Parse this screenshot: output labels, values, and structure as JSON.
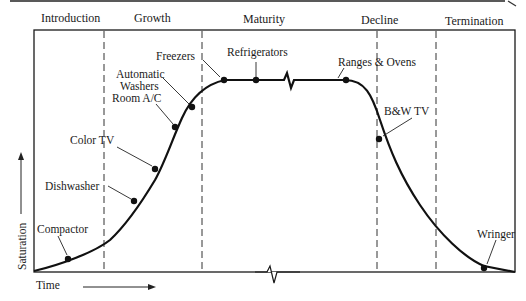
{
  "diagram": {
    "stages": [
      "Introduction",
      "Growth",
      "Maturity",
      "Decline",
      "Termination"
    ],
    "y_axis_label": "Saturation",
    "x_axis_label": "Time",
    "products": [
      {
        "name": "Compactor",
        "stage": "Introduction"
      },
      {
        "name": "Dishwasher",
        "stage": "Growth"
      },
      {
        "name": "Color TV",
        "stage": "Growth"
      },
      {
        "name": "Room A/C",
        "stage": "Growth"
      },
      {
        "name": "Automatic Washers",
        "stage": "Growth"
      },
      {
        "name": "Freezers",
        "stage": "Maturity"
      },
      {
        "name": "Refrigerators",
        "stage": "Maturity"
      },
      {
        "name": "Ranges & Ovens",
        "stage": "Maturity"
      },
      {
        "name": "B&W TV",
        "stage": "Decline"
      },
      {
        "name": "Wringer",
        "stage": "Termination"
      }
    ],
    "labels": {
      "compactor": "Compactor",
      "dishwasher": "Dishwasher",
      "color_tv": "Color TV",
      "room_ac": "Room A/C",
      "automatic_line1": "Automatic",
      "automatic_line2": "Washers",
      "freezers": "Freezers",
      "refrigerators": "Refrigerators",
      "ranges_ovens": "Ranges & Ovens",
      "bw_tv": "B&W TV",
      "wringer": "Wringer"
    }
  }
}
